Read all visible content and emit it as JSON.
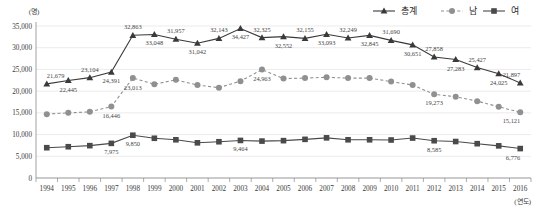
{
  "chart_data": {
    "type": "line",
    "title": "",
    "xlabel": "(연도)",
    "ylabel": "(명)",
    "ylim": [
      0,
      35000
    ],
    "ytick_labels": [
      "0",
      "5,000",
      "10,000",
      "15,000",
      "20,000",
      "25,000",
      "30,000",
      "35,000"
    ],
    "ytick_values": [
      0,
      5000,
      10000,
      15000,
      20000,
      25000,
      30000,
      35000
    ],
    "grid": true,
    "legend_position": "top-right",
    "categories": [
      "1994",
      "1995",
      "1996",
      "1997",
      "1998",
      "1999",
      "2000",
      "2001",
      "2002",
      "2003",
      "2004",
      "2005",
      "2006",
      "2007",
      "2008",
      "2009",
      "2010",
      "2011",
      "2012",
      "2013",
      "2014",
      "2015",
      "2016"
    ],
    "series": [
      {
        "name": "총계",
        "marker": "triangle",
        "line_style": "solid",
        "color": "#3a3a3a",
        "values": [
          21679,
          22445,
          23104,
          24391,
          32863,
          33048,
          31957,
          31042,
          32143,
          34427,
          32325,
          32552,
          32155,
          33093,
          32249,
          32845,
          31690,
          30651,
          27858,
          27283,
          25427,
          24025,
          21897
        ],
        "labels": [
          "21,679",
          "22,445",
          "23,104",
          "24,391",
          "32,863",
          "33,048",
          "31,957",
          "31,042",
          "32,143",
          "34,427",
          "32,325",
          "32,552",
          "32,155",
          "33,093",
          "32,249",
          "32,845",
          "31,690",
          "30,651",
          "27,858",
          "27,283",
          "25,427",
          "24,025",
          "21,897"
        ]
      },
      {
        "name": "남",
        "marker": "circle",
        "line_style": "dashed",
        "color": "#909090",
        "values": [
          14704,
          15000,
          15237,
          16446,
          23013,
          21600,
          22600,
          21400,
          20800,
          22300,
          24963,
          22900,
          23000,
          23200,
          23000,
          23000,
          22200,
          21400,
          19273,
          18700,
          17700,
          16400,
          15121
        ],
        "labels": [
          "",
          "",
          "",
          "16,446",
          "23,013",
          "",
          "",
          "",
          "",
          "",
          "24,963",
          "",
          "",
          "",
          "",
          "",
          "",
          "",
          "19,273",
          "",
          "",
          "",
          "15,121"
        ]
      },
      {
        "name": "여",
        "marker": "square",
        "line_style": "solid",
        "color": "#4a4a4a",
        "values": [
          6975,
          7200,
          7450,
          7975,
          9850,
          9150,
          8800,
          8100,
          8350,
          8650,
          8500,
          8600,
          8900,
          9250,
          8800,
          8800,
          8750,
          9200,
          8585,
          8400,
          7900,
          7400,
          6776
        ],
        "labels": [
          "",
          "",
          "",
          "7,975",
          "9,850",
          "",
          "",
          "",
          "",
          "9,464",
          "",
          "",
          "",
          "",
          "",
          "",
          "",
          "",
          "8,585",
          "",
          "",
          "",
          "6,776"
        ]
      }
    ]
  },
  "legend": {
    "items": [
      {
        "label": "총계",
        "marker": "triangle"
      },
      {
        "label": "남",
        "marker": "circle"
      },
      {
        "label": "여",
        "marker": "square"
      }
    ]
  }
}
